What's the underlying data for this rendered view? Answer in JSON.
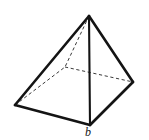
{
  "figure": {
    "kind": "geometric-solid",
    "name": "square-pyramid",
    "background_color": "#ffffff",
    "stroke_color": "#141414",
    "hidden_stroke_color": "#3a3a3a",
    "canvas": {
      "width": 149,
      "height": 140
    },
    "labels": [
      {
        "id": "base-label",
        "text": "b",
        "style": "italic",
        "x": 85,
        "y": 126
      }
    ],
    "vertices": {
      "apex": {
        "name": "apex",
        "x": 89,
        "y": 16
      },
      "front": {
        "name": "front-corner",
        "x": 90,
        "y": 125
      },
      "left": {
        "name": "left-corner",
        "x": 15,
        "y": 105
      },
      "right": {
        "name": "right-corner",
        "x": 133,
        "y": 82
      },
      "back": {
        "name": "back-corner",
        "x": 65,
        "y": 67
      }
    },
    "edges_solid": [
      {
        "name": "apex-to-left",
        "from": "apex",
        "to": "left"
      },
      {
        "name": "apex-to-front",
        "from": "apex",
        "to": "front"
      },
      {
        "name": "apex-to-right",
        "from": "apex",
        "to": "right"
      },
      {
        "name": "base-left-to-front",
        "from": "left",
        "to": "front"
      },
      {
        "name": "base-front-to-right",
        "from": "front",
        "to": "right"
      }
    ],
    "edges_hidden": [
      {
        "name": "apex-to-back",
        "from": "apex",
        "to": "back"
      },
      {
        "name": "base-left-to-back",
        "from": "left",
        "to": "back"
      },
      {
        "name": "base-back-to-right",
        "from": "back",
        "to": "right"
      }
    ],
    "axis_line": {
      "name": "vertical-height-line",
      "from": "apex",
      "to": "front"
    }
  }
}
